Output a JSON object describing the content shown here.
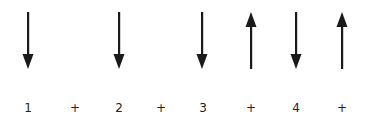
{
  "diagram": {
    "color": "#1a1a1a",
    "arrows": [
      {
        "x": 28,
        "direction": "down"
      },
      {
        "x": 119,
        "direction": "down"
      },
      {
        "x": 202,
        "direction": "down"
      },
      {
        "x": 251,
        "direction": "up"
      },
      {
        "x": 296,
        "direction": "down"
      },
      {
        "x": 342,
        "direction": "up"
      }
    ],
    "labels": [
      {
        "x": 28,
        "text": "1"
      },
      {
        "x": 75,
        "text": "+"
      },
      {
        "x": 119,
        "text": "2"
      },
      {
        "x": 161,
        "text": "+"
      },
      {
        "x": 203,
        "text": "3"
      },
      {
        "x": 251,
        "text": "+"
      },
      {
        "x": 296,
        "text": "4"
      },
      {
        "x": 342,
        "text": "+"
      }
    ]
  }
}
